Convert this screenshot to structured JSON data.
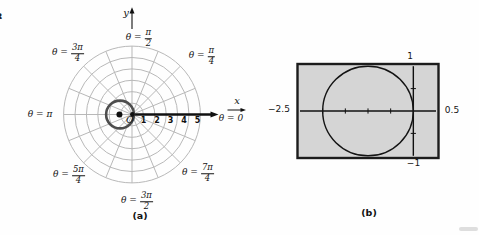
{
  "captions": {
    "a": "(a)",
    "b": "(b)"
  },
  "artifacts": {
    "edge_glyph": "8"
  },
  "polar": {
    "angle_labels": [
      {
        "pre": "θ =",
        "num": "π",
        "den": "2"
      },
      {
        "pre": "θ =",
        "num": "3π",
        "den": "4"
      },
      {
        "pre": "θ =",
        "num": "π",
        "den": "4"
      },
      {
        "pre": "θ = π"
      },
      {
        "pre": "θ = 0"
      },
      {
        "pre": "θ =",
        "num": "5π",
        "den": "4"
      },
      {
        "pre": "θ =",
        "num": "3π",
        "den": "2"
      },
      {
        "pre": "θ =",
        "num": "7π",
        "den": "4"
      }
    ]
  },
  "chart_data": [
    {
      "type": "line",
      "subtype": "polar-coordinate-grid",
      "caption": "(a)",
      "axes": {
        "x_label": "x",
        "y_label": "y",
        "origin_label": "O"
      },
      "grid": {
        "ring_radii": [
          1,
          2,
          3,
          4,
          5,
          6
        ],
        "angle_step_deg": 22.5,
        "grid_on": true
      },
      "x_tick_labels": [
        "1",
        "2",
        "3",
        "4",
        "5"
      ],
      "angle_labels": [
        "θ = π/2",
        "θ = 3π/4",
        "θ = π/4",
        "θ = π",
        "θ = 0",
        "θ = 5π/4",
        "θ = 3π/2",
        "θ = 7π/4"
      ],
      "series": [
        {
          "name": "polar curve: circle through the pole",
          "shape": "circle",
          "center_xy": [
            -1,
            0
          ],
          "radius": 1,
          "center_marked": true,
          "color": "#4d4d4d"
        }
      ]
    },
    {
      "type": "line",
      "subtype": "graphing-calculator-window",
      "caption": "(b)",
      "xlim": [
        -2.5,
        0.5
      ],
      "ylim": [
        -1,
        1
      ],
      "xscl": 0.5,
      "yscl": 0.5,
      "edge_value_labels": {
        "top": "1",
        "left": "−2.5",
        "right": "0.5",
        "bottom": "−1"
      },
      "series": [
        {
          "name": "circle",
          "shape": "circle",
          "center_xy": [
            -1,
            0
          ],
          "radius": 1,
          "color": "#141414"
        }
      ],
      "screen_fill": "#d5d5d5",
      "screen_border": "#1c1c1c"
    }
  ]
}
